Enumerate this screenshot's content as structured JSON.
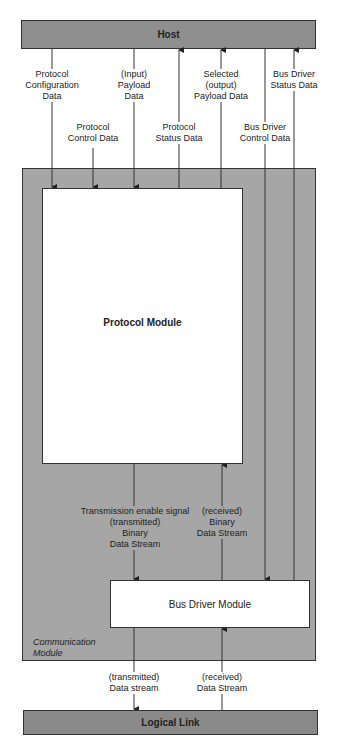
{
  "diagram": {
    "host": {
      "label": "Host"
    },
    "communication_module": {
      "label_line1": "Communication",
      "label_line2": "Module"
    },
    "protocol_module": {
      "label": "Protocol Module"
    },
    "bus_driver_module": {
      "label": "Bus Driver Module"
    },
    "logical_link": {
      "label": "Logical Link"
    },
    "host_signals": [
      {
        "lines": [
          "Protocol",
          "Configuration",
          "Data"
        ],
        "direction": "host-to-protocol"
      },
      {
        "lines": [
          "Protocol",
          "Control Data"
        ],
        "direction": "host-to-protocol"
      },
      {
        "lines": [
          "(Input)",
          "Payload",
          "Data"
        ],
        "direction": "host-to-protocol"
      },
      {
        "lines": [
          "Protocol",
          "Status Data"
        ],
        "direction": "protocol-to-host"
      },
      {
        "lines": [
          "Selected",
          "(output)",
          "Payload Data"
        ],
        "direction": "protocol-to-host"
      },
      {
        "lines": [
          "Bus Driver",
          "Control Data"
        ],
        "direction": "host-to-busdriver"
      },
      {
        "lines": [
          "Bus Driver",
          "Status Data"
        ],
        "direction": "busdriver-to-host"
      }
    ],
    "internal_signals": [
      {
        "lines": [
          "Transmission enable signal",
          "(transmitted)",
          "Binary",
          "Data Stream"
        ],
        "direction": "protocol-to-busdriver"
      },
      {
        "lines": [
          "(received)",
          "Binary",
          "Data Stream"
        ],
        "direction": "busdriver-to-protocol"
      }
    ],
    "link_signals": [
      {
        "lines": [
          "(transmitted)",
          "Data stream"
        ],
        "direction": "busdriver-to-link"
      },
      {
        "lines": [
          "(received)",
          "Data Stream"
        ],
        "direction": "link-to-busdriver"
      }
    ]
  }
}
